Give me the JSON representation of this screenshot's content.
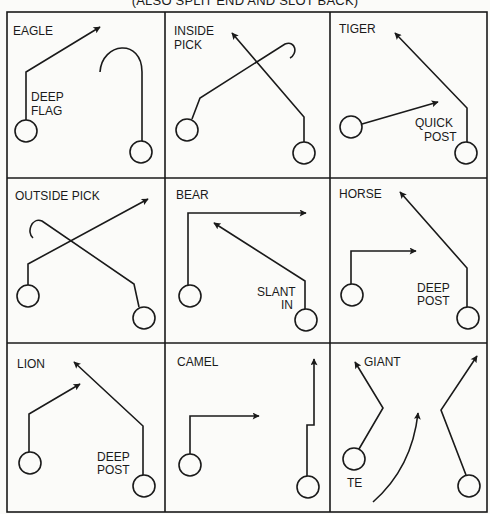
{
  "caption": "(ALSO SPLIT END AND SLOT BACK)",
  "grid": {
    "x": [
      7,
      165,
      330,
      487
    ],
    "y": [
      12,
      178,
      343,
      512
    ]
  },
  "plays": [
    {
      "name": "EAGLE",
      "notes": [
        "DEEP",
        "FLAG"
      ]
    },
    {
      "name_lines": [
        "INSIDE",
        "PICK"
      ]
    },
    {
      "name": "TIGER",
      "notes": [
        "QUICK",
        "POST"
      ]
    },
    {
      "name": "OUTSIDE PICK"
    },
    {
      "name": "BEAR",
      "notes": [
        "SLANT",
        "IN"
      ]
    },
    {
      "name": "HORSE",
      "notes": [
        "DEEP",
        "POST"
      ]
    },
    {
      "name": "LION",
      "notes": [
        "DEEP",
        "POST"
      ]
    },
    {
      "name": "CAMEL"
    },
    {
      "name": "GIANT",
      "notes": [
        "TE"
      ]
    }
  ],
  "colors": {
    "ink": "#1a1a1a",
    "paper": "#fbfbf9"
  }
}
